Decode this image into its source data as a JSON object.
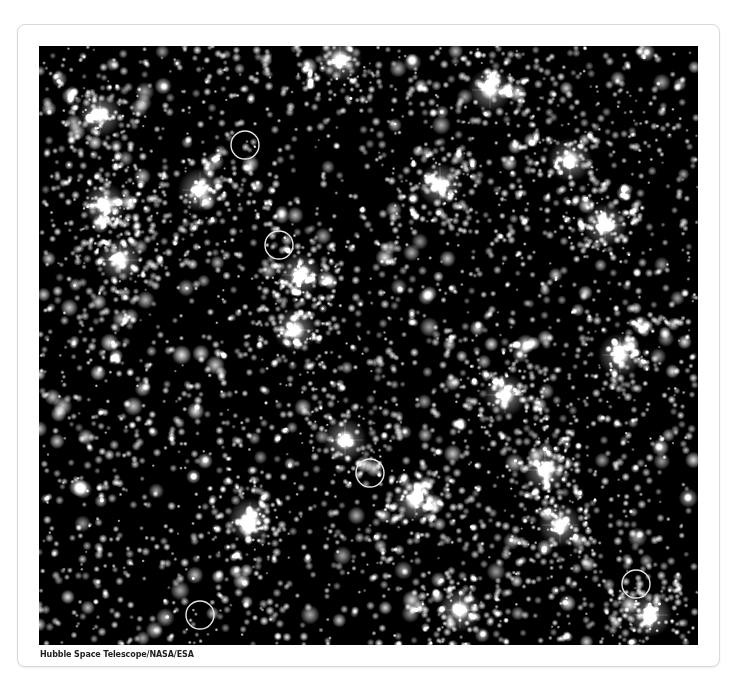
{
  "figure": {
    "alt": "Dense star field in a globular cluster with several stars circled",
    "caption": "Hubble Space Telescope/NASA/ESA",
    "background_color": "#000000",
    "star_color": "#ffffff",
    "marker_color": "#e6e6e6",
    "width": 659,
    "height": 599,
    "origin": [
      39,
      46
    ],
    "markers": [
      {
        "label": "circled-star-1",
        "cx": 245,
        "cy": 145,
        "r": 14
      },
      {
        "label": "circled-star-2",
        "cx": 279,
        "cy": 245,
        "r": 14
      },
      {
        "label": "circled-star-3",
        "cx": 370,
        "cy": 473,
        "r": 14
      },
      {
        "label": "circled-star-4",
        "cx": 636,
        "cy": 584,
        "r": 14
      },
      {
        "label": "circled-star-5",
        "cx": 200,
        "cy": 615,
        "r": 14
      }
    ],
    "bright_clusters": [
      [
        105,
        205
      ],
      [
        200,
        190
      ],
      [
        300,
        275
      ],
      [
        295,
        330
      ],
      [
        440,
        185
      ],
      [
        490,
        90
      ],
      [
        605,
        225
      ],
      [
        570,
        160
      ],
      [
        545,
        470
      ],
      [
        415,
        500
      ],
      [
        650,
        615
      ],
      [
        100,
        115
      ],
      [
        340,
        60
      ],
      [
        505,
        395
      ],
      [
        620,
        355
      ],
      [
        345,
        440
      ],
      [
        250,
        520
      ],
      [
        560,
        525
      ],
      [
        120,
        260
      ],
      [
        460,
        610
      ]
    ],
    "star_count": 4200,
    "seed": 20240531
  }
}
